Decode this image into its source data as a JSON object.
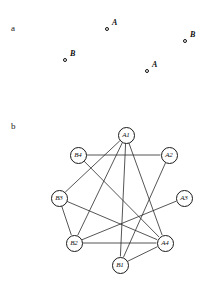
{
  "figure": {
    "panels": [
      {
        "id": "a",
        "letter": "a",
        "letter_x": 11,
        "letter_y": 24,
        "type": "scatter",
        "points": [
          {
            "name": "point-a-upper",
            "label": "A",
            "x": 108,
            "y": 30
          },
          {
            "name": "point-b-right",
            "label": "B",
            "x": 186,
            "y": 42
          },
          {
            "name": "point-b-left",
            "label": "B",
            "x": 66,
            "y": 61
          },
          {
            "name": "point-a-lower",
            "label": "A",
            "x": 148,
            "y": 72
          }
        ]
      },
      {
        "id": "b",
        "letter": "b",
        "letter_x": 11,
        "letter_y": 122,
        "type": "graph",
        "nodes": [
          {
            "id": "A1",
            "label": "A1",
            "x": 126,
            "y": 135
          },
          {
            "id": "A2",
            "label": "A2",
            "x": 169,
            "y": 155
          },
          {
            "id": "A3",
            "label": "A3",
            "x": 184,
            "y": 198
          },
          {
            "id": "A4",
            "label": "A4",
            "x": 165,
            "y": 243
          },
          {
            "id": "B1",
            "label": "B1",
            "x": 120,
            "y": 265
          },
          {
            "id": "B2",
            "label": "B2",
            "x": 74,
            "y": 243
          },
          {
            "id": "B3",
            "label": "B3",
            "x": 59,
            "y": 198
          },
          {
            "id": "B4",
            "label": "B4",
            "x": 78,
            "y": 155
          }
        ],
        "edges": [
          {
            "from": "B4",
            "to": "A2"
          },
          {
            "from": "B4",
            "to": "A4"
          },
          {
            "from": "B3",
            "to": "A1"
          },
          {
            "from": "B3",
            "to": "B2"
          },
          {
            "from": "B3",
            "to": "A4"
          },
          {
            "from": "B2",
            "to": "A4"
          },
          {
            "from": "B2",
            "to": "A1"
          },
          {
            "from": "B2",
            "to": "A3"
          },
          {
            "from": "B1",
            "to": "A1"
          },
          {
            "from": "B1",
            "to": "A2"
          },
          {
            "from": "B1",
            "to": "A4"
          },
          {
            "from": "A1",
            "to": "A4"
          }
        ]
      }
    ],
    "colors": {
      "ink": "#1a1a1a",
      "background": "#ffffff",
      "edge": "#2a2a2a"
    }
  }
}
